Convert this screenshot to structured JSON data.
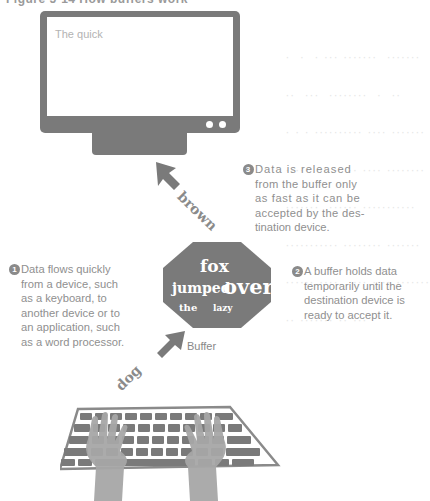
{
  "header": {
    "title_partial": "Figure 5-14 How buffers work"
  },
  "background_text": {
    "lines": [
      "·  ·  · ··· ·······  ·······",
      "··  ···  ········  ·  ··",
      "· · · ·········· ···· ·······",
      "·····  ·· ·  ·· ···· ········",
      "·······  ······ ···········",
      "··········· ········ ·······",
      "······ ····  ···· ···· ·······",
      "·· ······· ·· ···"
    ]
  },
  "monitor": {
    "screen_text": "The quick"
  },
  "arrows": {
    "upper_word": "brown",
    "lower_word": "dog"
  },
  "buffer": {
    "label": "Buffer",
    "words": {
      "line1": "fox",
      "line2a": "jumped",
      "line2b": "over",
      "line3a": "the",
      "line3b": "lazy"
    }
  },
  "steps": [
    {
      "number": "1",
      "text": "Data flows quickly from a device, such as a keyboard, to another device or to an application, such as a word processor."
    },
    {
      "number": "2",
      "text": "A buffer holds data temporarily until the destination device is ready to accept it."
    },
    {
      "number": "3",
      "text": "Data is released from the buffer only as fast as it can be accepted by the destination device."
    }
  ],
  "steps_display": {
    "step3_lines": [
      "Data is released",
      "from the buffer only",
      "as fast as it can be",
      "accepted by the des-",
      "tination device."
    ],
    "step1_lines": [
      "Data flows quickly",
      "from a device, such",
      "as a keyboard, to",
      "another device or to",
      "an application, such",
      "as a word processor."
    ],
    "step2_lines": [
      "A buffer holds data",
      "temporarily until the",
      "destination device is",
      "ready to accept it."
    ]
  },
  "colors": {
    "device_gray": "#7a7a7a",
    "text_gray": "#8f8f8f",
    "hands_gray": "#a6a6a6",
    "background": "#ffffff"
  }
}
